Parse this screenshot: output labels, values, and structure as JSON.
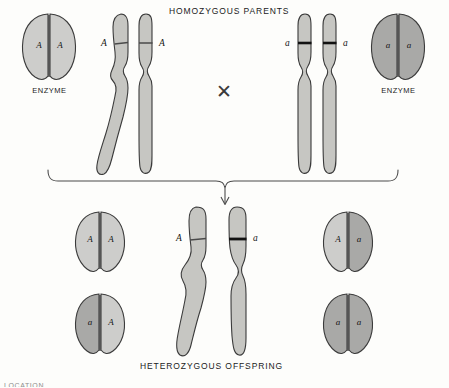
{
  "figure": {
    "kind": "genetics-inheritance-diagram",
    "background_color": "#fdfdfb",
    "top_heading": "HOMOZYGOUS  PARENTS",
    "bottom_heading": "HETEROZYGOUS  OFFSPRING",
    "cross_symbol": "✕",
    "edge_fragment": "LOCATION"
  },
  "palette": {
    "enzyme_light": "#cdcdcb",
    "enzyme_dark": "#a9a9a7",
    "chromosome_fill": "#c6c6c2",
    "outline": "#3b3b3b",
    "band_light": "#4a4a4a",
    "band_dark": "#121212",
    "text": "#1b1b1b"
  },
  "parents": {
    "left": {
      "enzyme": {
        "caption": "ENZYME",
        "left_lobe_allele": "A",
        "right_lobe_allele": "A",
        "left_lobe_shade": "light",
        "right_lobe_shade": "light"
      },
      "chromosomes": {
        "left_label": "A",
        "right_label": "A",
        "band_weight": "thin"
      }
    },
    "right": {
      "enzyme": {
        "caption": "ENZYME",
        "left_lobe_allele": "a",
        "right_lobe_allele": "a",
        "left_lobe_shade": "dark",
        "right_lobe_shade": "dark"
      },
      "chromosomes": {
        "left_label": "a",
        "right_label": "a",
        "band_weight": "thick"
      }
    }
  },
  "offspring": {
    "chromosomes": {
      "left_label": "A",
      "right_label": "a",
      "left_band_weight": "thin",
      "right_band_weight": "thick"
    },
    "enzymes": [
      {
        "position": "top-left",
        "left_lobe_allele": "A",
        "right_lobe_allele": "A",
        "left_lobe_shade": "light",
        "right_lobe_shade": "light"
      },
      {
        "position": "bottom-left",
        "left_lobe_allele": "a",
        "right_lobe_allele": "A",
        "left_lobe_shade": "dark",
        "right_lobe_shade": "light"
      },
      {
        "position": "top-right",
        "left_lobe_allele": "A",
        "right_lobe_allele": "a",
        "left_lobe_shade": "light",
        "right_lobe_shade": "dark"
      },
      {
        "position": "bottom-right",
        "left_lobe_allele": "a",
        "right_lobe_allele": "a",
        "left_lobe_shade": "dark",
        "right_lobe_shade": "dark"
      }
    ]
  }
}
